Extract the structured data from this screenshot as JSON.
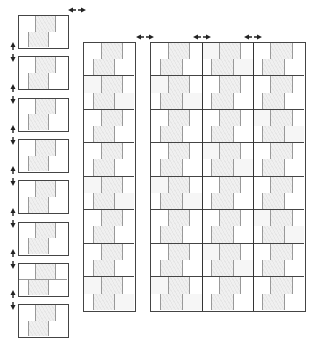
{
  "diagram": {
    "title": "",
    "colors": {
      "outline": "#444444",
      "joint": "#999999",
      "brick_fill": "#ebebeb"
    },
    "left_column": {
      "panels": 8,
      "layout": "single block each, 2 courses"
    },
    "middle_column": {
      "blocks": 8,
      "columns": 1
    },
    "right_group": {
      "blocks": 8,
      "columns": 3
    },
    "arrows": {
      "horizontal": [
        {
          "name": "expand-left-to-middle",
          "x": 68,
          "y": 10
        },
        {
          "name": "expand-middle-to-right",
          "x": 136,
          "y": 37
        },
        {
          "name": "expand-right-col1-col2",
          "x": 193,
          "y": 37
        },
        {
          "name": "expand-right-col2-col3",
          "x": 244,
          "y": 37
        }
      ],
      "vertical_count": 7
    }
  }
}
